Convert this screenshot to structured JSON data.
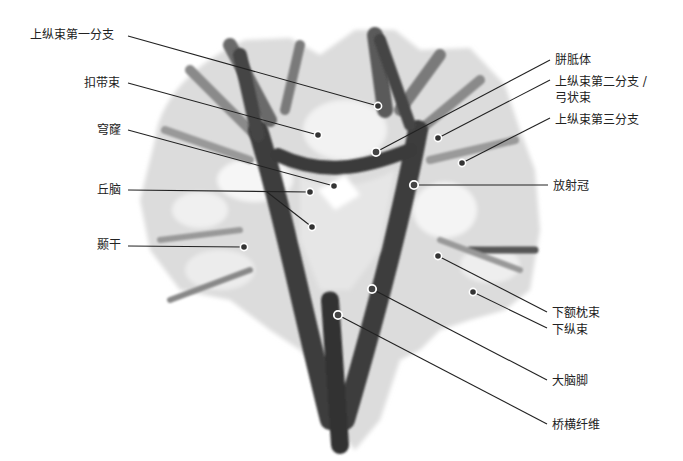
{
  "diagram": {
    "type": "anatomical-labeled-illustration",
    "left_labels": [
      {
        "text": "上纵束第一分支",
        "x": 30,
        "y": 28,
        "anchor": [
          128,
          36
        ],
        "markers": [
          {
            "x": 378,
            "y": 106,
            "style": "filled"
          }
        ]
      },
      {
        "text": "扣带束",
        "x": 84,
        "y": 76,
        "anchor": [
          128,
          83
        ],
        "markers": [
          {
            "x": 318,
            "y": 135,
            "style": "filled"
          }
        ]
      },
      {
        "text": "穹窿",
        "x": 97,
        "y": 123,
        "anchor": [
          128,
          130
        ],
        "markers": [
          {
            "x": 334,
            "y": 186,
            "style": "filled"
          }
        ]
      },
      {
        "text": "丘脑",
        "x": 97,
        "y": 183,
        "anchor": [
          128,
          190
        ],
        "markers": [
          {
            "x": 310,
            "y": 192,
            "style": "filled"
          },
          {
            "x": 312,
            "y": 227,
            "style": "filled",
            "via": [
              267,
              192
            ]
          }
        ]
      },
      {
        "text": "颞干",
        "x": 97,
        "y": 238,
        "anchor": [
          128,
          246
        ],
        "markers": [
          {
            "x": 244,
            "y": 247,
            "style": "filled"
          }
        ]
      }
    ],
    "right_labels": [
      {
        "text": "胼胝体",
        "x": 555,
        "y": 53,
        "anchor": [
          550,
          60
        ],
        "markers": [
          {
            "x": 376,
            "y": 152,
            "style": "hollow"
          }
        ]
      },
      {
        "text": "上纵束第二分支 /",
        "x": 555,
        "y": 75,
        "anchor": [
          550,
          80
        ],
        "markers": [
          {
            "x": 438,
            "y": 138,
            "style": "filled"
          }
        ]
      },
      {
        "text": "弓状束",
        "x": 555,
        "y": 91
      },
      {
        "text": "上纵束第三分支",
        "x": 555,
        "y": 113,
        "anchor": [
          550,
          118
        ],
        "markers": [
          {
            "x": 462,
            "y": 163,
            "style": "filled"
          }
        ]
      },
      {
        "text": "放射冠",
        "x": 553,
        "y": 179,
        "anchor": [
          548,
          185
        ],
        "markers": [
          {
            "x": 414,
            "y": 185,
            "style": "hollow"
          }
        ]
      },
      {
        "text": "下额枕束",
        "x": 552,
        "y": 306,
        "anchor": [
          547,
          312
        ],
        "markers": [
          {
            "x": 438,
            "y": 256,
            "style": "filled"
          }
        ]
      },
      {
        "text": "下纵束",
        "x": 552,
        "y": 323,
        "anchor": [
          547,
          328
        ],
        "markers": [
          {
            "x": 473,
            "y": 292,
            "style": "filled"
          }
        ]
      },
      {
        "text": "大脑脚",
        "x": 552,
        "y": 374,
        "anchor": [
          547,
          380
        ],
        "markers": [
          {
            "x": 372,
            "y": 289,
            "style": "hollow"
          }
        ]
      },
      {
        "text": "桥横纤维",
        "x": 552,
        "y": 418,
        "anchor": [
          547,
          424
        ],
        "markers": [
          {
            "x": 338,
            "y": 315,
            "style": "hollow"
          }
        ]
      }
    ],
    "colors": {
      "line": "#222222",
      "marker_fill": "#333333",
      "marker_ring": "#ffffff",
      "fiber_dark": "#3a3a3a",
      "fiber_mid": "#8a8a8a",
      "fiber_light": "#d8d8d8"
    }
  }
}
